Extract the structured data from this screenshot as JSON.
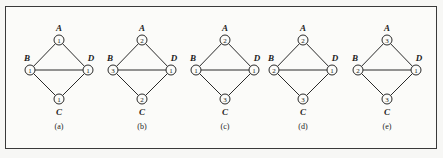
{
  "figure": {
    "node_names": {
      "A": "A",
      "B": "B",
      "C": "C",
      "D": "D"
    },
    "edges": [
      [
        "A",
        "B"
      ],
      [
        "A",
        "D"
      ],
      [
        "B",
        "D"
      ],
      [
        "B",
        "C"
      ],
      [
        "C",
        "D"
      ]
    ],
    "panels": [
      {
        "label": "(a)",
        "values": {
          "A": "1",
          "B": "1",
          "C": "1",
          "D": "1"
        }
      },
      {
        "label": "(b)",
        "values": {
          "A": "2",
          "B": "3",
          "C": "2",
          "D": "1"
        }
      },
      {
        "label": "(c)",
        "values": {
          "A": "2",
          "B": "1",
          "C": "3",
          "D": "1"
        }
      },
      {
        "label": "(d)",
        "values": {
          "A": "2",
          "B": "2",
          "C": "3",
          "D": "1"
        }
      },
      {
        "label": "(e)",
        "values": {
          "A": "3",
          "B": "2",
          "C": "3",
          "D": "1"
        }
      }
    ]
  }
}
